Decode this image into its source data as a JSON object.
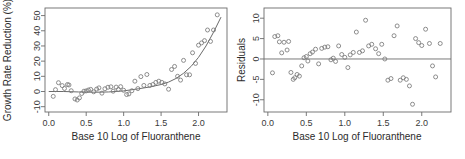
{
  "figure": {
    "background_color": "#ffffff",
    "point_color": "#7a7a7a",
    "line_color": "#6b6b6b",
    "text_color": "#2b2b2b"
  },
  "chart_data": [
    {
      "type": "scatter",
      "title": "",
      "xlabel": "Base 10 Log of Fluoranthene",
      "ylabel": "Growth Rate Reduction (%)",
      "xlim": [
        -0.05,
        2.38
      ],
      "ylim": [
        -13.5,
        55.0
      ],
      "xticks": [
        0.0,
        0.5,
        1.0,
        1.5,
        2.0
      ],
      "xticklabels": [
        "0.0",
        "0.5",
        "1.0",
        "1.5",
        "2.0"
      ],
      "yticks": [
        -10,
        0,
        10,
        20,
        30,
        40,
        50
      ],
      "yticklabels": [
        "-10",
        "0",
        "10",
        "20",
        "30",
        "40",
        "50"
      ],
      "grid": false,
      "legend": false,
      "marker": "open-circle",
      "x": [
        0.06,
        0.09,
        0.13,
        0.18,
        0.21,
        0.25,
        0.27,
        0.3,
        0.35,
        0.38,
        0.41,
        0.44,
        0.47,
        0.5,
        0.53,
        0.56,
        0.6,
        0.64,
        0.67,
        0.71,
        0.75,
        0.79,
        0.83,
        0.86,
        0.9,
        0.93,
        0.96,
        1.0,
        1.04,
        1.07,
        1.11,
        1.15,
        1.19,
        1.23,
        1.27,
        1.31,
        1.35,
        1.39,
        1.43,
        1.47,
        1.51,
        1.55,
        1.6,
        1.64,
        1.68,
        1.72,
        1.76,
        1.8,
        1.84,
        1.88,
        1.92,
        1.96,
        2.0,
        2.04,
        2.08,
        2.12,
        2.16,
        2.2,
        2.25
      ],
      "y": [
        -3.2,
        1.2,
        5.8,
        3.9,
        2.0,
        4.6,
        4.3,
        0.5,
        -4.9,
        -5.6,
        -4.2,
        -1.3,
        0.2,
        0.4,
        1.0,
        1.4,
        -0.2,
        1.6,
        2.4,
        -1.1,
        1.8,
        2.8,
        3.1,
        0.2,
        2.9,
        1.3,
        3.2,
        0.8,
        -2.0,
        -1.6,
        0.5,
        6.8,
        1.9,
        9.8,
        4.0,
        11.2,
        4.0,
        4.6,
        6.0,
        6.8,
        6.0,
        5.0,
        1.5,
        14.5,
        16.5,
        10.0,
        7.5,
        20.5,
        11.0,
        11.0,
        25.5,
        18.5,
        30.5,
        32.0,
        33.5,
        40.5,
        33.0,
        40.5,
        50.5
      ],
      "fit_curve": {
        "label": "exponential fit",
        "x": [
          0.0,
          0.2,
          0.4,
          0.6,
          0.8,
          1.0,
          1.2,
          1.35,
          1.5,
          1.6,
          1.7,
          1.8,
          1.9,
          2.0,
          2.1,
          2.2,
          2.3
        ],
        "y": [
          0.0,
          0.0,
          -0.3,
          -0.5,
          -0.3,
          0.4,
          1.8,
          3.0,
          4.6,
          6.2,
          8.6,
          12.0,
          16.5,
          22.5,
          30.0,
          39.0,
          49.0
        ]
      }
    },
    {
      "type": "scatter",
      "title": "",
      "xlabel": "Base 10 Log of Fluoranthene",
      "ylabel": "Residuals",
      "xlim": [
        -0.05,
        2.38
      ],
      "ylim": [
        -13.0,
        12.5
      ],
      "xticks": [
        0.0,
        0.5,
        1.0,
        1.5,
        2.0
      ],
      "xticklabels": [
        "0.0",
        "0.5",
        "1.0",
        "1.5",
        "2.0"
      ],
      "yticks": [
        -10,
        -5,
        0,
        5,
        10
      ],
      "yticklabels": [
        "-10",
        "-5",
        "0",
        "5",
        "10"
      ],
      "grid": false,
      "legend": false,
      "marker": "open-circle",
      "reference_line_y": 0,
      "x": [
        0.06,
        0.09,
        0.13,
        0.15,
        0.18,
        0.21,
        0.25,
        0.27,
        0.3,
        0.33,
        0.35,
        0.38,
        0.41,
        0.44,
        0.47,
        0.5,
        0.52,
        0.55,
        0.58,
        0.62,
        0.66,
        0.7,
        0.74,
        0.78,
        0.82,
        0.85,
        0.88,
        0.92,
        0.96,
        1.0,
        1.04,
        1.07,
        1.11,
        1.15,
        1.19,
        1.23,
        1.27,
        1.31,
        1.35,
        1.4,
        1.44,
        1.48,
        1.52,
        1.56,
        1.6,
        1.64,
        1.68,
        1.72,
        1.76,
        1.8,
        1.84,
        1.88,
        1.92,
        1.96,
        2.0,
        2.05,
        2.1,
        2.14,
        2.18,
        2.24
      ],
      "y": [
        -3.4,
        5.5,
        5.7,
        4.2,
        1.5,
        4.1,
        2.2,
        4.3,
        -3.3,
        -5.0,
        -4.6,
        -3.8,
        -4.2,
        -1.7,
        0.3,
        0.6,
        -0.5,
        1.3,
        1.7,
        2.4,
        -1.2,
        2.6,
        2.9,
        3.0,
        -0.2,
        0.2,
        -0.6,
        3.2,
        1.1,
        0.4,
        -2.1,
        1.0,
        1.6,
        6.6,
        1.6,
        2.0,
        9.5,
        3.2,
        3.6,
        2.5,
        1.3,
        3.6,
        0.0,
        -5.2,
        -4.8,
        5.7,
        8.1,
        -5.2,
        -4.6,
        -5.0,
        -6.6,
        -11.1,
        5.0,
        4.0,
        3.3,
        7.3,
        3.8,
        -1.7,
        -4.4,
        3.8
      ]
    }
  ]
}
